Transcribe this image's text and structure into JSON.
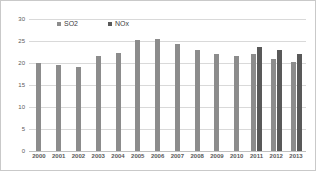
{
  "chart_data": {
    "type": "bar",
    "title": "",
    "xlabel": "",
    "ylabel": "",
    "ylim": [
      0,
      30
    ],
    "yticks": [
      0,
      5,
      10,
      15,
      20,
      25,
      30
    ],
    "grid": true,
    "legend_position": "top-inside",
    "categories": [
      "2000",
      "2001",
      "2002",
      "2003",
      "2004",
      "2005",
      "2006",
      "2007",
      "2008",
      "2009",
      "2010",
      "2011",
      "2012",
      "2013"
    ],
    "series": [
      {
        "name": "SO2",
        "color": "#8c8c8c",
        "values": [
          20.0,
          19.5,
          19.2,
          21.5,
          22.3,
          25.2,
          25.5,
          24.4,
          23.0,
          22.0,
          21.6,
          22.0,
          20.8,
          20.2
        ]
      },
      {
        "name": "NOx",
        "color": "#595959",
        "values": [
          null,
          null,
          null,
          null,
          null,
          null,
          null,
          null,
          null,
          null,
          null,
          23.6,
          23.0,
          22.0
        ]
      }
    ]
  },
  "legend": {
    "items": [
      {
        "label": "SO2",
        "color": "#8c8c8c"
      },
      {
        "label": "NOx",
        "color": "#595959"
      }
    ]
  }
}
